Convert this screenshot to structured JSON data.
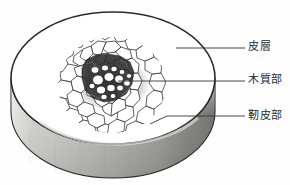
{
  "figure": {
    "name": "plant-stem-cross-section-diagram",
    "background_color": "#fefefe"
  },
  "disc": {
    "top_face_color": "#ffffff",
    "outline_color": "#2a2a2a",
    "rim_light_color": "#d8d8d4",
    "rim_mid_color": "#b4b4b0",
    "rim_dark_color": "#7d7d79",
    "ellipse": {
      "center_x": 113,
      "center_y": 78,
      "radius_x": 102,
      "radius_y": 66,
      "thickness": 34
    }
  },
  "stele": {
    "name": "vascular-bundle",
    "center_x": 112,
    "center_y": 85,
    "radius_x": 54,
    "radius_y": 48,
    "cell_line_color": "#1c1c1c",
    "core_fill_color": "#3d3d3d"
  },
  "labels": [
    {
      "id": "cortex",
      "text": "皮層",
      "reading": "hisou",
      "meaning": "cortex",
      "text_x": 248,
      "text_y": 41,
      "leader": {
        "from_x": 176,
        "from_y": 48,
        "to_x": 245,
        "to_y": 48
      }
    },
    {
      "id": "xylem",
      "text": "木質部",
      "reading": "mokushitsubu",
      "meaning": "xylem",
      "text_x": 248,
      "text_y": 74,
      "leader": {
        "from_x": 118,
        "from_y": 81,
        "to_x": 245,
        "to_y": 81
      }
    },
    {
      "id": "phloem",
      "text": "靭皮部",
      "reading": "jinpibu",
      "meaning": "phloem",
      "text_x": 248,
      "text_y": 110,
      "leader": {
        "from_x": 150,
        "from_y": 124,
        "to_x": 245,
        "to_y": 117
      }
    }
  ],
  "leader_line": {
    "color": "#333333",
    "width": 0.9
  }
}
